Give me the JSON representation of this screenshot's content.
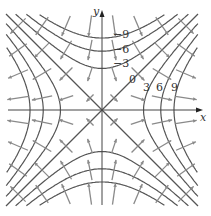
{
  "figure": {
    "function": "f(x,y) = x^2 - y^2",
    "axes": {
      "x_label": "x",
      "y_label": "y"
    },
    "level_labels": [
      {
        "text": "−9",
        "k": -9
      },
      {
        "text": "−6",
        "k": -6
      },
      {
        "text": "−3",
        "k": -3
      },
      {
        "text": "0",
        "k": 0
      },
      {
        "text": "3",
        "k": 3
      },
      {
        "text": "6",
        "k": 6
      },
      {
        "text": "9",
        "k": 9
      }
    ],
    "levels": [
      -9,
      -6,
      -3,
      0,
      3,
      6,
      9
    ],
    "arrow_grid": [
      -3.5,
      -2.5,
      -1.5,
      -0.5,
      0.5,
      1.5,
      2.5,
      3.5
    ],
    "colors": {
      "curve": "#555555",
      "arrow": "#8a8a8a",
      "axis": "#444444"
    },
    "layout": {
      "origin_x": 102,
      "origin_y": 110,
      "scale": 24,
      "extent": 4
    }
  }
}
